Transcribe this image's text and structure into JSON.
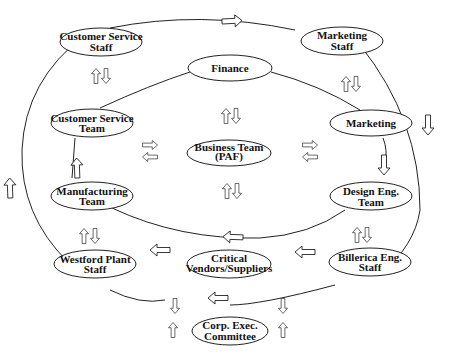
{
  "diagram": {
    "type": "organizational-flow",
    "nodes": {
      "cs_staff": {
        "line1": "Customer Service",
        "line2": "Staff"
      },
      "mkt_staff": {
        "line1": "Marketing",
        "line2": "Staff"
      },
      "finance": {
        "line1": "Finance",
        "line2": ""
      },
      "cs_team": {
        "line1": "Customer Service",
        "line2": "Team"
      },
      "marketing": {
        "line1": "Marketing",
        "line2": ""
      },
      "business": {
        "line1": "Business Team",
        "line2": "(PAF)"
      },
      "mfg_team": {
        "line1": "Manufacturing",
        "line2": "Team"
      },
      "design": {
        "line1": "Design Eng.",
        "line2": "Team"
      },
      "westford": {
        "line1": "Westford Plant",
        "line2": "Staff"
      },
      "vendors": {
        "line1": "Critical",
        "line2": "Vendors/Suppliers"
      },
      "billerica": {
        "line1": "Billerica Eng.",
        "line2": "Staff"
      },
      "corp": {
        "line1": "Corp. Exec.",
        "line2": "Committee"
      }
    },
    "loops": [
      "outer-staff-loop",
      "inner-team-loop"
    ],
    "colors": {
      "line": "#222222",
      "fill": "#ffffff",
      "text": "#111111"
    }
  }
}
